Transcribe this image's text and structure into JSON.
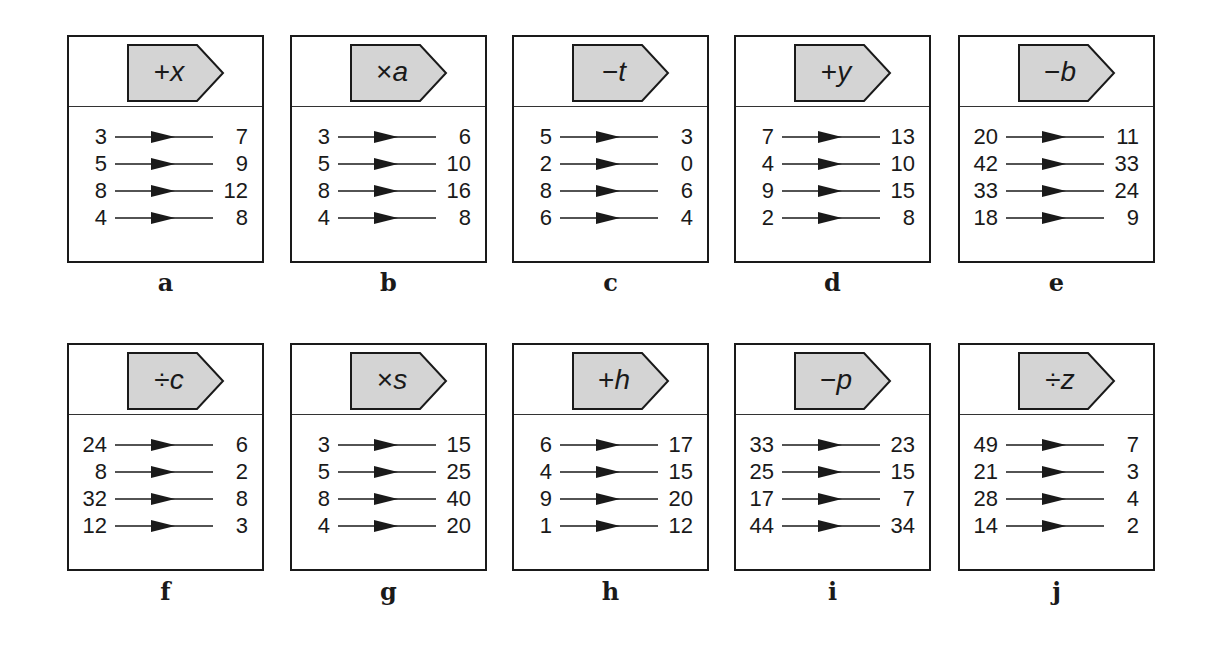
{
  "puzzle_cards": [
    {
      "label": "a",
      "op": "+",
      "var": "x",
      "rule": "+x",
      "pairs": [
        [
          "3",
          "7"
        ],
        [
          "5",
          "9"
        ],
        [
          "8",
          "12"
        ],
        [
          "4",
          "8"
        ]
      ]
    },
    {
      "label": "b",
      "op": "×",
      "var": "a",
      "rule": "×a",
      "pairs": [
        [
          "3",
          "6"
        ],
        [
          "5",
          "10"
        ],
        [
          "8",
          "16"
        ],
        [
          "4",
          "8"
        ]
      ]
    },
    {
      "label": "c",
      "op": "−",
      "var": "t",
      "rule": "−t",
      "pairs": [
        [
          "5",
          "3"
        ],
        [
          "2",
          "0"
        ],
        [
          "8",
          "6"
        ],
        [
          "6",
          "4"
        ]
      ]
    },
    {
      "label": "d",
      "op": "+",
      "var": "y",
      "rule": "+y",
      "pairs": [
        [
          "7",
          "13"
        ],
        [
          "4",
          "10"
        ],
        [
          "9",
          "15"
        ],
        [
          "2",
          "8"
        ]
      ]
    },
    {
      "label": "e",
      "op": "−",
      "var": "b",
      "rule": "−b",
      "pairs": [
        [
          "20",
          "11"
        ],
        [
          "42",
          "33"
        ],
        [
          "33",
          "24"
        ],
        [
          "18",
          "9"
        ]
      ]
    },
    {
      "label": "f",
      "op": "÷",
      "var": "c",
      "rule": "÷c",
      "pairs": [
        [
          "24",
          "6"
        ],
        [
          "8",
          "2"
        ],
        [
          "32",
          "8"
        ],
        [
          "12",
          "3"
        ]
      ]
    },
    {
      "label": "g",
      "op": "×",
      "var": "s",
      "rule": "×s",
      "pairs": [
        [
          "3",
          "15"
        ],
        [
          "5",
          "25"
        ],
        [
          "8",
          "40"
        ],
        [
          "4",
          "20"
        ]
      ]
    },
    {
      "label": "h",
      "op": "+",
      "var": "h",
      "rule": "+h",
      "pairs": [
        [
          "6",
          "17"
        ],
        [
          "4",
          "15"
        ],
        [
          "9",
          "20"
        ],
        [
          "1",
          "12"
        ]
      ]
    },
    {
      "label": "i",
      "op": "−",
      "var": "p",
      "rule": "−p",
      "pairs": [
        [
          "33",
          "23"
        ],
        [
          "25",
          "15"
        ],
        [
          "17",
          "7"
        ],
        [
          "44",
          "34"
        ]
      ]
    },
    {
      "label": "j",
      "op": "÷",
      "var": "z",
      "rule": "÷z",
      "pairs": [
        [
          "49",
          "7"
        ],
        [
          "21",
          "3"
        ],
        [
          "28",
          "4"
        ],
        [
          "14",
          "2"
        ]
      ]
    }
  ],
  "colors": {
    "tag_fill": "#d4d4d4",
    "border": "#1a1a1a",
    "background": "#ffffff"
  }
}
